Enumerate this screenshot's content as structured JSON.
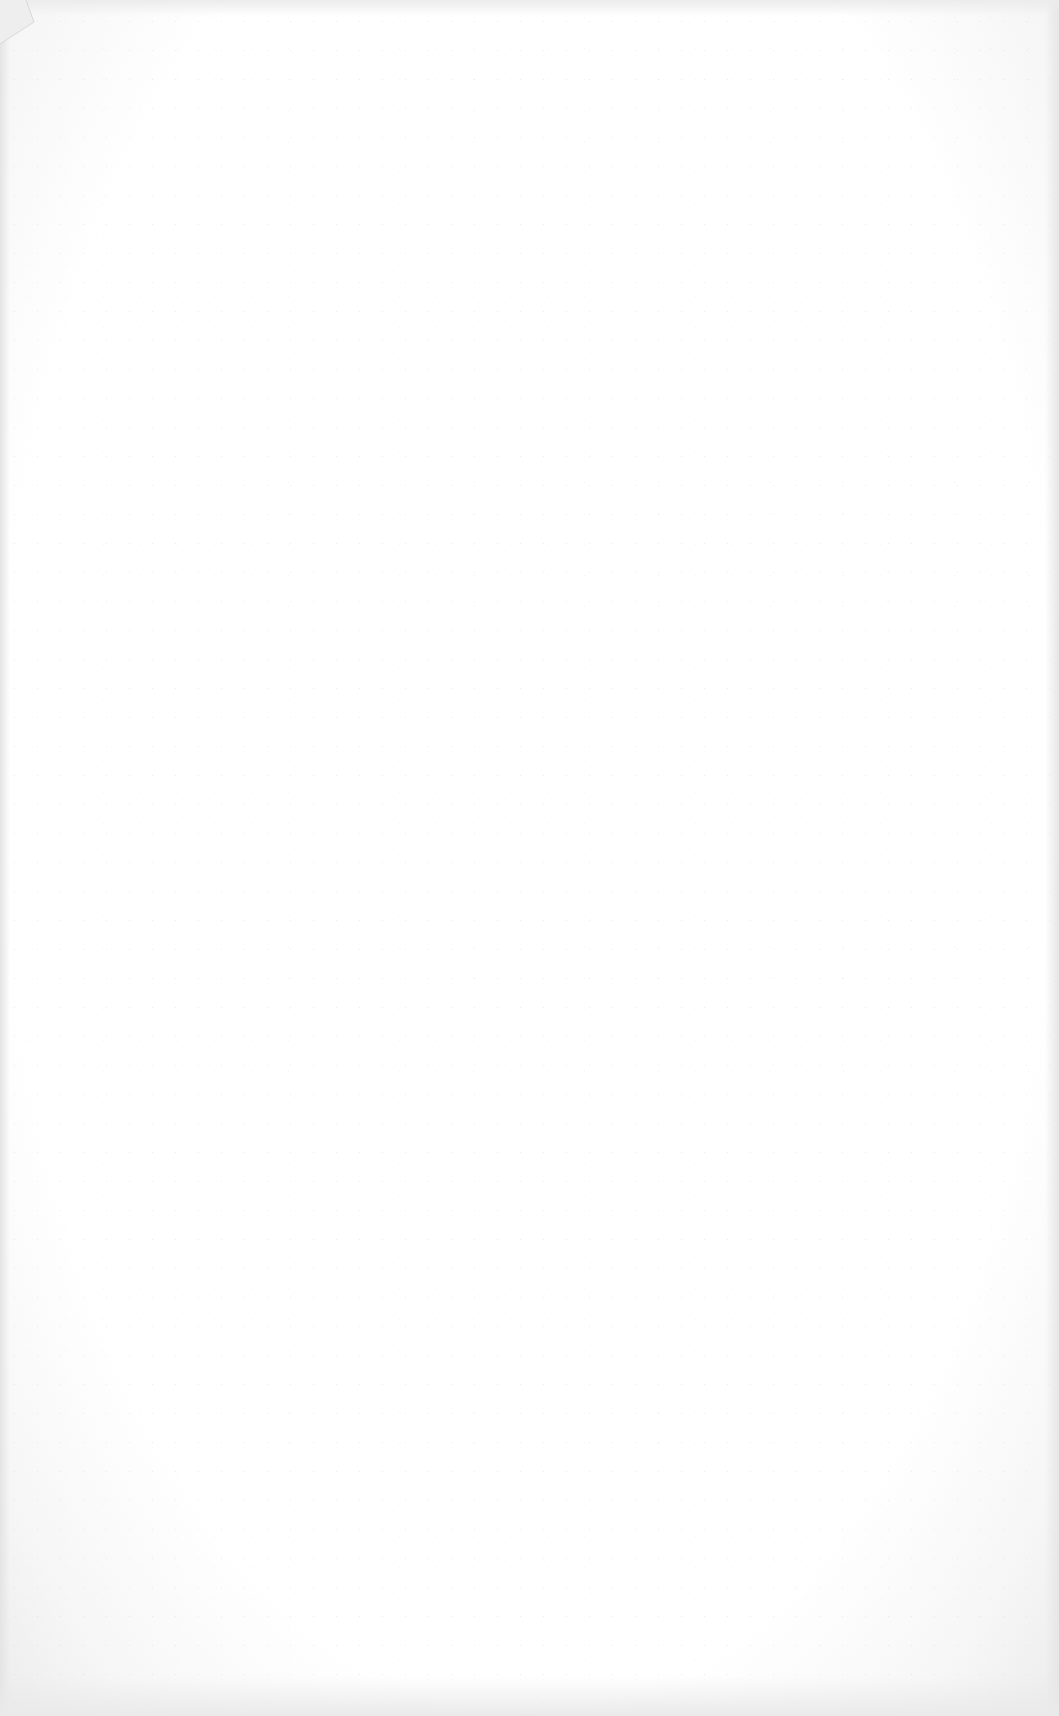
{
  "document": {
    "type": "scanned-page",
    "content": "",
    "background_color": "#ffffff",
    "edge_color": "#e6e6e6"
  }
}
